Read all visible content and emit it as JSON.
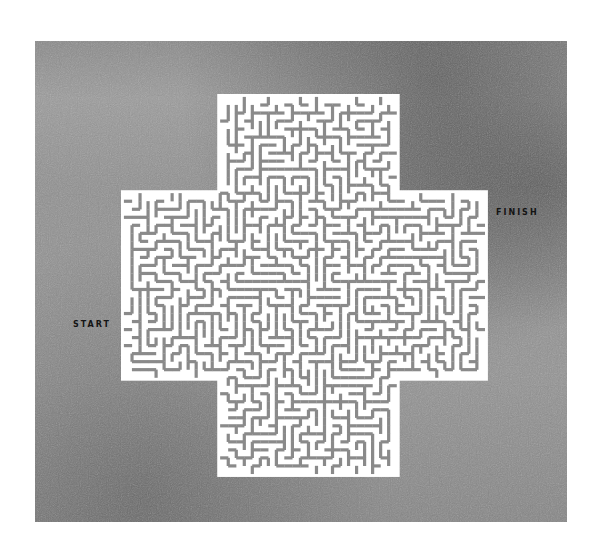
{
  "puzzle": {
    "type": "maze",
    "shape": "cross",
    "start_label": "START",
    "finish_label": "FINISH",
    "colors": {
      "background": "#ffffff",
      "panel": "#909090",
      "maze_paths": "#ffffff",
      "maze_walls": "#8a8a8a",
      "label_text": "#141414"
    }
  }
}
